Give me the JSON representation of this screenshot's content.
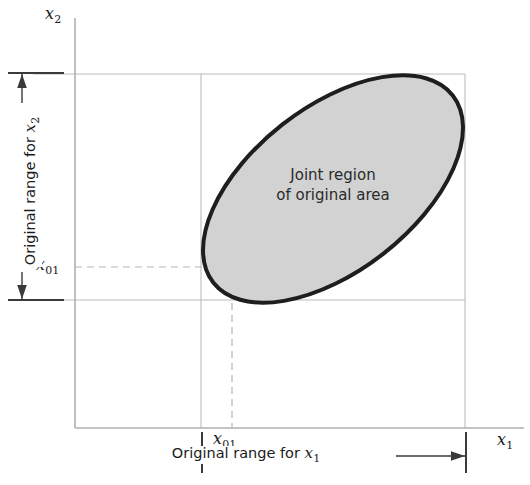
{
  "figure": {
    "kind": "schematic-plot",
    "background_color": "#ffffff",
    "axes": {
      "x_axis_label": "x1",
      "y_axis_label": "x2",
      "axis_color": "#aaaaaa",
      "origin_px": {
        "x": 75,
        "y": 428
      }
    },
    "tick_labels": {
      "x_origin_value": "x01",
      "y_origin_value": "x01"
    },
    "annotations": {
      "y_range_label": "Original range for x2",
      "x_range_label": "Original range for x1",
      "region_line1": "Joint region",
      "region_line2": "of original area"
    },
    "region": {
      "name": "joint-region-ellipse",
      "fill_color": "#d2d2d2",
      "stroke_color": "#1e1e1e",
      "stroke_width": 4,
      "center_px": {
        "x": 333,
        "y": 189
      },
      "semi_major_px": 152,
      "semi_minor_px": 82,
      "rotation_deg": -38
    },
    "gridlines": {
      "color": "#bcbcbc",
      "dashed_color": "#b5b5b5",
      "top_y_px": 74,
      "bottom_y_px": 300,
      "left_x_px": 201,
      "right_x_px": 465,
      "dashed_x_px": 232,
      "dashed_y_px": 267
    }
  },
  "chart_data": {
    "type": "scatter",
    "title": "",
    "xlabel": "x1",
    "ylabel": "x2",
    "grid": true,
    "legend": "none",
    "annotations": [
      {
        "text": "Joint region of original area",
        "x": 333,
        "y": 189
      },
      {
        "text": "Original range for x1",
        "x": 246,
        "y": 455
      },
      {
        "text": "Original range for x2",
        "x": 22,
        "y": 188
      }
    ],
    "reference_lines": [
      {
        "name": "x1-lower-bound",
        "orientation": "vertical",
        "value": "x01",
        "px": 201,
        "style": "solid"
      },
      {
        "name": "x1-upper-bound",
        "orientation": "vertical",
        "px": 465,
        "style": "solid"
      },
      {
        "name": "x2-upper-bound",
        "orientation": "horizontal",
        "px": 74,
        "style": "solid"
      },
      {
        "name": "x2-lower-bound",
        "orientation": "horizontal",
        "value": "x01",
        "px": 300,
        "style": "solid"
      },
      {
        "name": "x1-center-dashed",
        "orientation": "vertical",
        "px": 232,
        "style": "dashed"
      },
      {
        "name": "x2-center-dashed",
        "orientation": "horizontal",
        "px": 267,
        "style": "dashed"
      }
    ],
    "region_shape": {
      "type": "ellipse",
      "label": "Joint region of original area",
      "center": [
        333,
        189
      ],
      "rx": 152,
      "ry": 82,
      "rotation_deg": -38,
      "fill": "#d2d2d2",
      "stroke": "#1e1e1e"
    },
    "x_range_extent": {
      "from_px": 202,
      "to_px": 466,
      "label": "Original range for x1"
    },
    "y_range_extent": {
      "from_px": 73,
      "to_px": 300,
      "label": "Original range for x2"
    }
  }
}
